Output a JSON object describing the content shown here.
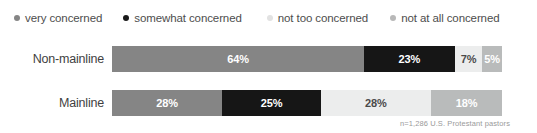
{
  "legend": {
    "position": "top",
    "items": [
      {
        "label": "very concerned",
        "color": "#858585",
        "dot": "legend-dot-very-concerned"
      },
      {
        "label": "somewhat concerned",
        "color": "#1a1a1a",
        "dot": "legend-dot-somewhat-concerned"
      },
      {
        "label": "not too concerned",
        "color": "#e2e2e2",
        "dot": "legend-dot-not-too-concerned"
      },
      {
        "label": "not at all concerned",
        "color": "#b8b8b8",
        "dot": "legend-dot-not-at-all-concerned"
      }
    ]
  },
  "footnote": "n=1,286 U.S. Protestant pastors",
  "chart_data": {
    "type": "bar",
    "orientation": "horizontal",
    "stacked": true,
    "normalized": true,
    "title": "",
    "subtitle": "",
    "xlabel": "",
    "ylabel": "",
    "xlim": [
      0,
      100
    ],
    "grid": false,
    "legend_position": "top",
    "categories": [
      "Non-mainline",
      "Mainline"
    ],
    "series": [
      {
        "name": "very concerned",
        "color": "#858585",
        "text_color": "#ffffff",
        "values": [
          64,
          28
        ],
        "labels": [
          "64%",
          "28%"
        ]
      },
      {
        "name": "somewhat concerned",
        "color": "#161616",
        "text_color": "#ffffff",
        "values": [
          23,
          25
        ],
        "labels": [
          "23%",
          "25%"
        ]
      },
      {
        "name": "not too concerned",
        "color": "#eceded",
        "text_color": "#4a4a4a",
        "values": [
          7,
          28
        ],
        "labels": [
          "7%",
          "28%"
        ]
      },
      {
        "name": "not at all concerned",
        "color": "#b9bbbb",
        "text_color": "#ffffff",
        "values": [
          5,
          18
        ],
        "labels": [
          "5%",
          "18%"
        ]
      }
    ],
    "annotations": [
      "n=1,286 U.S. Protestant pastors"
    ]
  }
}
